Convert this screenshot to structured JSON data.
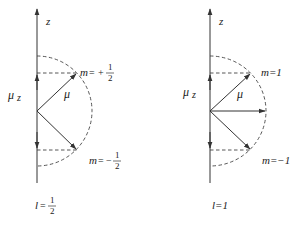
{
  "colors": {
    "line": "#333333",
    "dashed": "#444444",
    "text": "#222222",
    "background": "#ffffff"
  },
  "left_panel": {
    "axis_label": "z",
    "mu_z_label": "μ",
    "mu_z_sub": "z",
    "vector_label": "μ",
    "m_upper": {
      "prefix": "m",
      "eq": "=",
      "sign": "+",
      "num": "1",
      "den": "2"
    },
    "m_lower": {
      "prefix": "m",
      "eq": "=",
      "sign": "−",
      "num": "1",
      "den": "2"
    },
    "l_label": {
      "prefix": "l",
      "eq": "=",
      "num": "1",
      "den": "2"
    }
  },
  "right_panel": {
    "axis_label": "z",
    "mu_z_label": "μ",
    "mu_z_sub": "z",
    "vector_label": "μ",
    "m_upper": "m=1",
    "m_lower": "m=−1",
    "l_label": "l=1"
  }
}
